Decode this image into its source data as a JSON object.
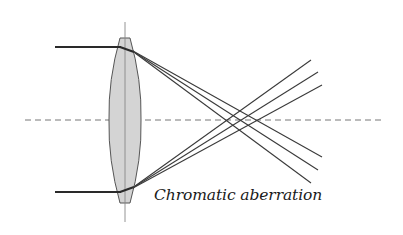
{
  "figure": {
    "caption": "Chromatic aberration",
    "colors": {
      "lens_fill": "#d4d4d4",
      "lens_stroke": "#555555",
      "ray": "#3a3a3a",
      "incoming_ray": "#2a2a2a",
      "axis": "#777777",
      "lens_axis": "#888888"
    },
    "optical_axis": {
      "y": 120,
      "x1": 25,
      "x2": 385,
      "style": "dashed"
    },
    "lens": {
      "center_x": 125,
      "top_y": 38,
      "bottom_y": 203,
      "cap_half_width": 5,
      "max_half_width": 16,
      "vertical_line": {
        "y1": 22,
        "y2": 222
      }
    },
    "incoming_rays": [
      {
        "y": 47,
        "x1": 55,
        "x2": 120
      },
      {
        "y": 192,
        "x1": 55,
        "x2": 120
      }
    ],
    "refracted_rays_from_top": [
      {
        "from": [
          133,
          52
        ],
        "to": [
          322,
          157
        ]
      },
      {
        "from": [
          134,
          52
        ],
        "to": [
          318,
          170
        ]
      },
      {
        "from": [
          135,
          52
        ],
        "to": [
          311,
          183
        ]
      }
    ],
    "refracted_rays_from_bottom": [
      {
        "from": [
          133,
          187
        ],
        "to": [
          322,
          85
        ]
      },
      {
        "from": [
          134,
          187
        ],
        "to": [
          318,
          72
        ]
      },
      {
        "from": [
          135,
          187
        ],
        "to": [
          311,
          60
        ]
      }
    ]
  }
}
